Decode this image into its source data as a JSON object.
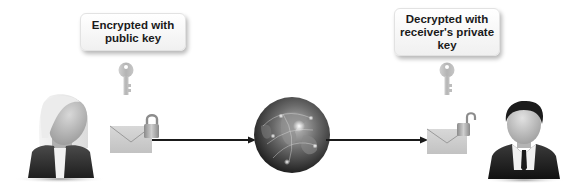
{
  "diagram": {
    "sender": {
      "role": "sender",
      "figure": "woman-avatar-icon",
      "callout_lines": [
        "Encrypted with",
        "public key"
      ],
      "key": "public-key-icon",
      "envelope": "envelope-icon",
      "lock_state": "locked"
    },
    "network": {
      "figure": "globe-icon"
    },
    "receiver": {
      "role": "receiver",
      "figure": "man-avatar-icon",
      "callout_lines": [
        "Decrypted with",
        "receiver's private",
        "key"
      ],
      "key": "private-key-icon",
      "envelope": "envelope-icon",
      "lock_state": "unlocked"
    },
    "flow": [
      {
        "from": "sender-envelope",
        "to": "globe"
      },
      {
        "from": "globe",
        "to": "receiver-envelope"
      }
    ],
    "colors": {
      "arrow": "#1a1a1a",
      "callout_bg": "#f6f6f6",
      "text": "#1a1a1a",
      "suit": "#2a2a2a",
      "envelope": "#cfcfcf",
      "key": "#b8b8b8"
    }
  }
}
